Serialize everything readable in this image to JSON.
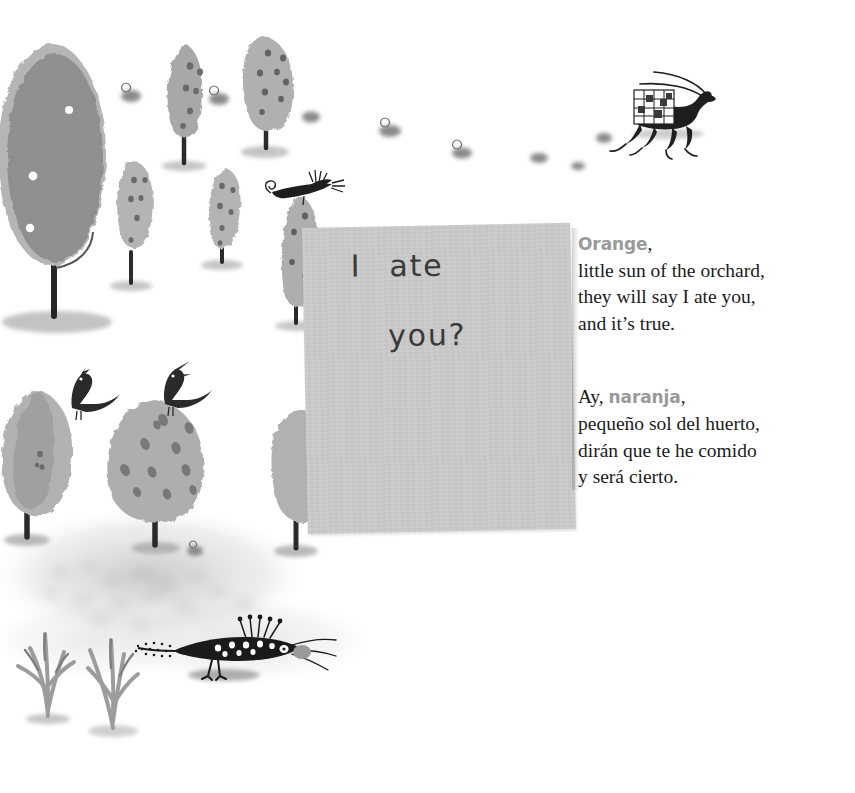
{
  "page": {
    "background_color": "#ffffff",
    "width": 855,
    "height": 793
  },
  "note_card": {
    "name": "handwritten-note",
    "background_color": "#c8c8c8",
    "ink_color": "#3a3a3a",
    "line_1_word_1": "I",
    "line_1_word_2": "ate",
    "line_2": "you?"
  },
  "poem": {
    "accent_color": "#9a9a9a",
    "text_color": "#1b1b1b",
    "english": {
      "kicker": "Orange",
      "kicker_punct": ",",
      "lines": [
        "little sun of the orchard,",
        "they will say I ate you,",
        "and it’s true."
      ]
    },
    "spanish": {
      "lead": "Ay, ",
      "kicker": "naranja",
      "kicker_punct": ",",
      "lines": [
        "pequeño sol del huerto,",
        "dirán que te he comido",
        "y será cierto."
      ]
    }
  },
  "illustration": {
    "description": "watercolor orchard scene",
    "palette": {
      "tree_dark": "#8e8e8e",
      "tree_mid": "#a6a6a6",
      "tree_light": "#b8b8b8",
      "fruit_spot": "#6e6e6e",
      "fruit_light": "#ffffff",
      "trunk": "#2e2e2e",
      "ground_wash": "#cfcfcf",
      "ink_black": "#1e1e1e"
    },
    "elements": [
      {
        "name": "tree-large-left",
        "label": "large orange tree"
      },
      {
        "name": "tree-tall-upper-mid",
        "label": "tall spotted tree"
      },
      {
        "name": "tree-tall-upper-right",
        "label": "tall spotted tree"
      },
      {
        "name": "tree-small-left",
        "label": "small spotted tree"
      },
      {
        "name": "tree-small-mid",
        "label": "small spotted tree"
      },
      {
        "name": "tree-behind-note",
        "label": "tree behind note card"
      },
      {
        "name": "tree-lower-left",
        "label": "round tree with singing bird"
      },
      {
        "name": "tree-lower-mid",
        "label": "round spotted tree with singing bird"
      },
      {
        "name": "tree-lower-right",
        "label": "tree behind note"
      },
      {
        "name": "gazelle-with-crate",
        "label": "horned animal carrying orange crate"
      },
      {
        "name": "crested-bird-on-tree",
        "label": "long crested bird with spiral tail"
      },
      {
        "name": "singing-bird-left",
        "label": "singing bird"
      },
      {
        "name": "singing-bird-right",
        "label": "singing bird"
      },
      {
        "name": "peacock-bird",
        "label": "long peacock-like bird"
      },
      {
        "name": "shrub-left",
        "label": "branching shrub"
      },
      {
        "name": "shrub-mid",
        "label": "branching shrub"
      },
      {
        "name": "snail-cluster",
        "label": "small snails and stones"
      }
    ]
  }
}
